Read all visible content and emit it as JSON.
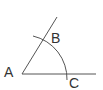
{
  "diagram": {
    "type": "geometry-angle-construction",
    "vertex": {
      "label": "A",
      "x": 22,
      "y": 74
    },
    "points": [
      {
        "label": "B",
        "x": 42,
        "y": 42
      },
      {
        "label": "C",
        "x": 66,
        "y": 74
      }
    ],
    "rays": [
      {
        "from": "A",
        "through": "B",
        "end": [
          57,
          17
        ]
      },
      {
        "from": "A",
        "through": "C",
        "end": [
          96,
          74
        ]
      }
    ],
    "arc": {
      "center": "A",
      "radius": 44
    },
    "labels": {
      "a": "A",
      "b": "B",
      "c": "C"
    },
    "colors": {
      "line": "#555555",
      "text": "#333333"
    }
  }
}
